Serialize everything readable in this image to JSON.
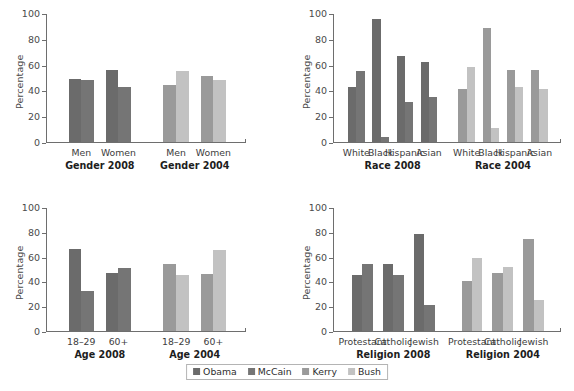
{
  "axis": {
    "ylabel": "Percentage",
    "yticks": [
      "0",
      "20",
      "40",
      "60",
      "80",
      "100"
    ],
    "ymin": 0,
    "ymax": 100
  },
  "legend": {
    "position": "bottom-center",
    "items": [
      {
        "label": "Obama",
        "color": "#6b6b6b"
      },
      {
        "label": "McCain",
        "color": "#757575"
      },
      {
        "label": "Kerry",
        "color": "#9a9a9a"
      },
      {
        "label": "Bush",
        "color": "#c2c2c2"
      }
    ]
  },
  "colors": {
    "obama": "#6b6b6b",
    "mccain": "#757575",
    "kerry": "#9a9a9a",
    "bush": "#c2c2c2",
    "axis": "#6e6e6e",
    "text": "#3a3a3a"
  },
  "panels": [
    {
      "id": "gender",
      "groups": [
        {
          "label": "Gender 2008",
          "categories": [
            "Men",
            "Women"
          ],
          "series": [
            {
              "name": "Obama",
              "values": [
                49,
                56
              ]
            },
            {
              "name": "McCain",
              "values": [
                48,
                43
              ]
            }
          ]
        },
        {
          "label": "Gender 2004",
          "categories": [
            "Men",
            "Women"
          ],
          "series": [
            {
              "name": "Kerry",
              "values": [
                44,
                51
              ]
            },
            {
              "name": "Bush",
              "values": [
                55,
                48
              ]
            }
          ]
        }
      ]
    },
    {
      "id": "race",
      "groups": [
        {
          "label": "Race 2008",
          "categories": [
            "White",
            "Black",
            "Hispanic",
            "Asian"
          ],
          "series": [
            {
              "name": "Obama",
              "values": [
                43,
                95,
                67,
                62
              ]
            },
            {
              "name": "McCain",
              "values": [
                55,
                4,
                31,
                35
              ]
            }
          ]
        },
        {
          "label": "Race 2004",
          "categories": [
            "White",
            "Black",
            "Hispanic",
            "Asian"
          ],
          "series": [
            {
              "name": "Kerry",
              "values": [
                41,
                88,
                56,
                56
              ]
            },
            {
              "name": "Bush",
              "values": [
                58,
                11,
                43,
                41
              ]
            }
          ]
        }
      ]
    },
    {
      "id": "age",
      "groups": [
        {
          "label": "Age 2008",
          "categories": [
            "18–29",
            "60+"
          ],
          "series": [
            {
              "name": "Obama",
              "values": [
                66,
                47
              ]
            },
            {
              "name": "McCain",
              "values": [
                32,
                51
              ]
            }
          ]
        },
        {
          "label": "Age 2004",
          "categories": [
            "18–29",
            "60+"
          ],
          "series": [
            {
              "name": "Kerry",
              "values": [
                54,
                46
              ]
            },
            {
              "name": "Bush",
              "values": [
                45,
                65
              ]
            }
          ]
        }
      ]
    },
    {
      "id": "religion",
      "groups": [
        {
          "label": "Religion 2008",
          "categories": [
            "Protestant",
            "Catholic",
            "Jewish"
          ],
          "series": [
            {
              "name": "Obama",
              "values": [
                45,
                54,
                78
              ]
            },
            {
              "name": "McCain",
              "values": [
                54,
                45,
                21
              ]
            }
          ]
        },
        {
          "label": "Religion 2004",
          "categories": [
            "Protestant",
            "Catholic",
            "Jewish"
          ],
          "series": [
            {
              "name": "Kerry",
              "values": [
                40,
                47,
                74
              ]
            },
            {
              "name": "Bush",
              "values": [
                59,
                52,
                25
              ]
            }
          ]
        }
      ]
    }
  ],
  "chart_data": {
    "type": "bar",
    "title": "",
    "xlabel": "",
    "ylabel": "Percentage",
    "ylim": [
      0,
      100
    ],
    "grid": false,
    "legend_position": "bottom-center",
    "layout": "2x2 panels of grouped vertical bars",
    "panels": [
      {
        "name": "Gender",
        "categories": [
          "Men (2008)",
          "Women (2008)",
          "Men (2004)",
          "Women (2004)"
        ],
        "series": [
          {
            "name": "Obama",
            "values": [
              49,
              56,
              null,
              null
            ]
          },
          {
            "name": "McCain",
            "values": [
              48,
              43,
              null,
              null
            ]
          },
          {
            "name": "Kerry",
            "values": [
              null,
              null,
              44,
              51
            ]
          },
          {
            "name": "Bush",
            "values": [
              null,
              null,
              55,
              48
            ]
          }
        ]
      },
      {
        "name": "Race",
        "categories": [
          "White (2008)",
          "Black (2008)",
          "Hispanic (2008)",
          "Asian (2008)",
          "White (2004)",
          "Black (2004)",
          "Hispanic (2004)",
          "Asian (2004)"
        ],
        "series": [
          {
            "name": "Obama",
            "values": [
              43,
              95,
              67,
              62,
              null,
              null,
              null,
              null
            ]
          },
          {
            "name": "McCain",
            "values": [
              55,
              4,
              31,
              35,
              null,
              null,
              null,
              null
            ]
          },
          {
            "name": "Kerry",
            "values": [
              null,
              null,
              null,
              null,
              41,
              88,
              56,
              56
            ]
          },
          {
            "name": "Bush",
            "values": [
              null,
              null,
              null,
              null,
              58,
              11,
              43,
              41
            ]
          }
        ]
      },
      {
        "name": "Age",
        "categories": [
          "18–29 (2008)",
          "60+ (2008)",
          "18–29 (2004)",
          "60+ (2004)"
        ],
        "series": [
          {
            "name": "Obama",
            "values": [
              66,
              47,
              null,
              null
            ]
          },
          {
            "name": "McCain",
            "values": [
              32,
              51,
              null,
              null
            ]
          },
          {
            "name": "Kerry",
            "values": [
              null,
              null,
              54,
              46
            ]
          },
          {
            "name": "Bush",
            "values": [
              null,
              null,
              45,
              65
            ]
          }
        ]
      },
      {
        "name": "Religion",
        "categories": [
          "Protestant (2008)",
          "Catholic (2008)",
          "Jewish (2008)",
          "Protestant (2004)",
          "Catholic (2004)",
          "Jewish (2004)"
        ],
        "series": [
          {
            "name": "Obama",
            "values": [
              45,
              54,
              78,
              null,
              null,
              null
            ]
          },
          {
            "name": "McCain",
            "values": [
              54,
              45,
              21,
              null,
              null,
              null
            ]
          },
          {
            "name": "Kerry",
            "values": [
              null,
              null,
              null,
              40,
              47,
              74
            ]
          },
          {
            "name": "Bush",
            "values": [
              null,
              null,
              null,
              59,
              52,
              25
            ]
          }
        ]
      }
    ]
  }
}
